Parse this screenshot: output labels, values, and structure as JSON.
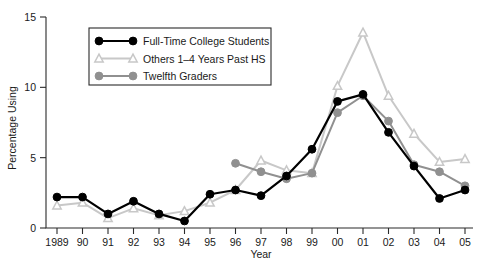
{
  "chart_data": {
    "type": "line",
    "title": "",
    "xlabel": "Year",
    "ylabel": "Percentage Using",
    "categories": [
      "1989",
      "90",
      "91",
      "92",
      "93",
      "94",
      "95",
      "96",
      "97",
      "98",
      "99",
      "00",
      "01",
      "02",
      "03",
      "04",
      "05"
    ],
    "xlim": [
      0,
      16
    ],
    "ylim": [
      0,
      15
    ],
    "yticks": [
      0,
      5,
      10,
      15
    ],
    "ytick_labels": [
      "0",
      "5",
      "10",
      "15"
    ],
    "grid": false,
    "legend_position": "upper left",
    "series": [
      {
        "name": "Full-Time College Students",
        "marker": "circle-filled",
        "color": "#000000",
        "values": [
          2.2,
          2.2,
          1.0,
          1.9,
          1.0,
          0.5,
          2.4,
          2.7,
          2.3,
          3.7,
          5.6,
          9.0,
          9.5,
          6.8,
          4.4,
          2.1,
          2.7
        ]
      },
      {
        "name": "Others 1–4 Years Past HS",
        "marker": "triangle-open",
        "color": "#c8c8c8",
        "values": [
          1.6,
          1.8,
          0.7,
          1.4,
          0.9,
          1.2,
          1.8,
          2.7,
          4.8,
          4.1,
          3.9,
          10.1,
          13.9,
          9.4,
          6.7,
          4.7,
          4.9
        ]
      },
      {
        "name": "Twelfth Graders",
        "marker": "circle-filled",
        "color": "#909090",
        "values": [
          null,
          null,
          null,
          null,
          null,
          null,
          null,
          4.6,
          4.0,
          3.5,
          3.9,
          8.2,
          9.4,
          7.6,
          4.5,
          4.0,
          3.0
        ]
      }
    ]
  },
  "legend": {
    "entries": [
      {
        "label": "Full-Time College Students",
        "color": "#000000",
        "marker": "circle"
      },
      {
        "label": "Others 1–4 Years Past HS",
        "color": "#c8c8c8",
        "marker": "triangle"
      },
      {
        "label": "Twelfth Graders",
        "color": "#909090",
        "marker": "circle"
      }
    ]
  },
  "colors": {
    "series_college": "#000000",
    "series_others": "#c8c8c8",
    "series_twelfth": "#909090",
    "axis": "#2b2b2b",
    "background": "#ffffff"
  }
}
